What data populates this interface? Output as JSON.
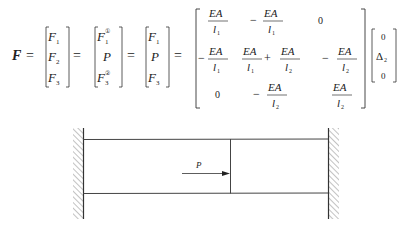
{
  "equation": {
    "lhs": "F",
    "eq": "=",
    "vec1": [
      "F",
      "F",
      "F"
    ],
    "vec1_sub": [
      "1",
      "2",
      "3"
    ],
    "vec2": [
      "F",
      "P",
      "F"
    ],
    "vec2_sub": [
      "1",
      "",
      "3"
    ],
    "vec2_sup": [
      "①",
      "",
      "②"
    ],
    "vec3": [
      "F",
      "P",
      "F"
    ],
    "vec3_sub": [
      "1",
      "",
      "3"
    ],
    "matrix": {
      "EA": "EA",
      "l1": "l",
      "l1_sub": "1",
      "l2": "l",
      "l2_sub": "2",
      "minus": "−",
      "plus": "+",
      "zero": "0"
    },
    "disp_vector": [
      "0",
      "Δ",
      "0"
    ],
    "disp_sub": "2"
  },
  "figure": {
    "load_label": "P"
  }
}
